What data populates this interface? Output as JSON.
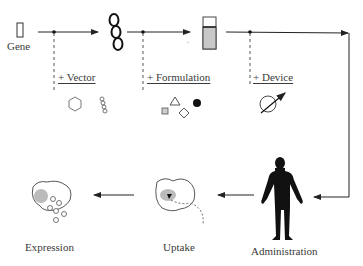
{
  "diagram": {
    "stages_top": [
      {
        "id": "gene",
        "label": "Gene",
        "icon": "gene-rectangle-icon"
      },
      {
        "id": "vector",
        "icon": "dna-coil-icon"
      },
      {
        "id": "formulation",
        "icon": "vial-icon"
      }
    ],
    "additions": [
      {
        "label": "+ Vector",
        "icons": [
          "hexagon-icon",
          "dna-chain-icon"
        ]
      },
      {
        "label": "+ Formulation",
        "icons": [
          "square-icon",
          "triangle-icon",
          "diamond-icon",
          "filled-circle-icon"
        ]
      },
      {
        "label": "+ Device",
        "icons": [
          "circle-arrow-device-icon"
        ]
      }
    ],
    "stages_bottom": [
      {
        "label": "Expression",
        "icon": "cell-expression-icon"
      },
      {
        "label": "Uptake",
        "icon": "cell-uptake-icon"
      },
      {
        "label": "Administration",
        "icon": "human-figure-icon"
      }
    ],
    "colors": {
      "line": "#222222",
      "fill_gray": "#bdbdbd",
      "dash": "#555555"
    }
  }
}
